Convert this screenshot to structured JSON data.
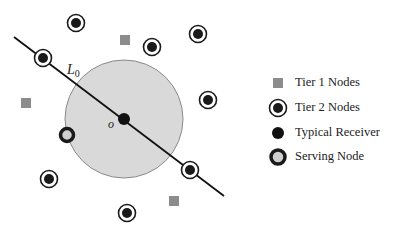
{
  "diagram": {
    "line_label": "L",
    "line_label_sub": "0",
    "origin_label": "o",
    "coverage_circle": {
      "cx": 124,
      "cy": 119,
      "r": 59,
      "fill": "#d9d9d9",
      "stroke": "#8a8a8a"
    },
    "line": {
      "x1": 14,
      "y1": 37,
      "x2": 224,
      "y2": 196
    },
    "typical_receiver": {
      "x": 124,
      "y": 119
    },
    "serving_node": {
      "x": 67,
      "y": 135
    },
    "tier1_nodes": [
      {
        "x": 125,
        "y": 40
      },
      {
        "x": 26,
        "y": 103
      },
      {
        "x": 174,
        "y": 201
      }
    ],
    "tier2_nodes": [
      {
        "x": 76,
        "y": 23
      },
      {
        "x": 43,
        "y": 58
      },
      {
        "x": 152,
        "y": 47
      },
      {
        "x": 198,
        "y": 34
      },
      {
        "x": 208,
        "y": 100
      },
      {
        "x": 190,
        "y": 170
      },
      {
        "x": 49,
        "y": 179
      },
      {
        "x": 127,
        "y": 213
      }
    ]
  },
  "legend": {
    "items": [
      {
        "label": "Tier 1 Nodes",
        "icon": "gray-square-icon"
      },
      {
        "label": "Tier 2 Nodes",
        "icon": "ringed-dot-icon"
      },
      {
        "label": "Typical Receiver",
        "icon": "black-dot-icon"
      },
      {
        "label": "Serving Node",
        "icon": "thick-ring-icon"
      }
    ]
  },
  "colors": {
    "tier1": "#8c8c8c",
    "node_dark": "#1a1a1a",
    "circle_fill": "#d9d9d9",
    "serving_inner": "#cfcfcf"
  }
}
